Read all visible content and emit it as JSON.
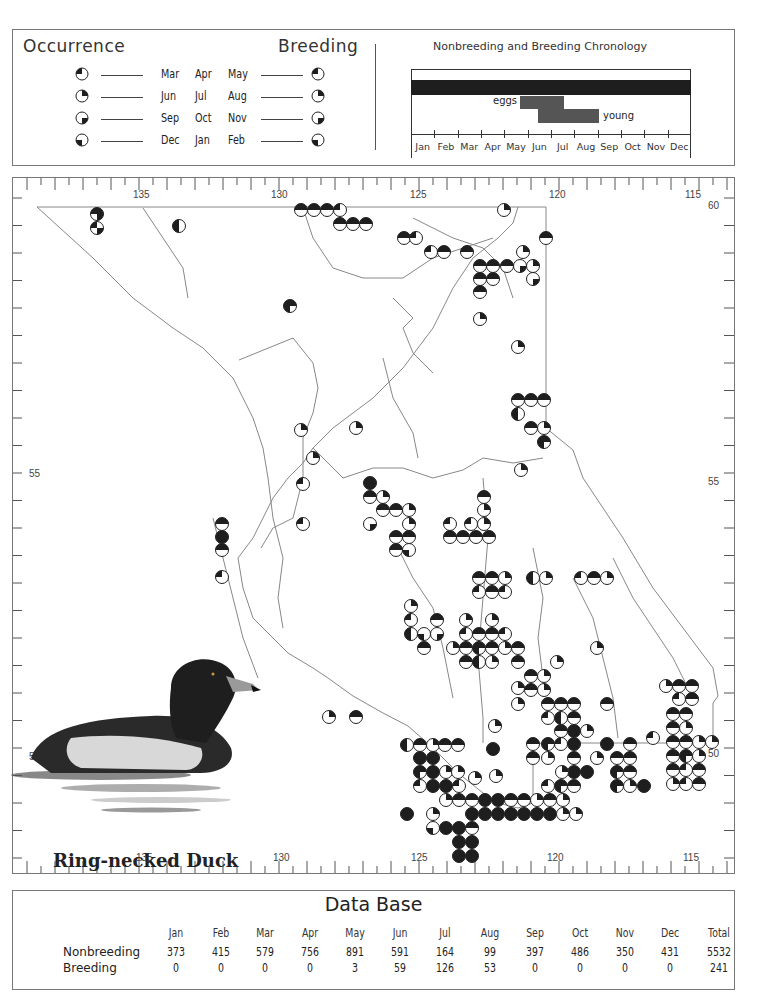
{
  "legend": {
    "occurrence_title": "Occurrence",
    "breeding_title": "Breeding",
    "rows": [
      {
        "months": [
          "Mar",
          "Apr",
          "May"
        ],
        "quadrant": "tl"
      },
      {
        "months": [
          "Jun",
          "Jul",
          "Aug"
        ],
        "quadrant": "tr"
      },
      {
        "months": [
          "Sep",
          "Oct",
          "Nov"
        ],
        "quadrant": "br"
      },
      {
        "months": [
          "Dec",
          "Jan",
          "Feb"
        ],
        "quadrant": "bl"
      }
    ]
  },
  "chronology": {
    "title": "Nonbreeding and Breeding Chronology",
    "months": [
      "Jan",
      "Feb",
      "Mar",
      "Apr",
      "May",
      "Jun",
      "Jul",
      "Aug",
      "Sep",
      "Oct",
      "Nov",
      "Dec"
    ],
    "eggs_label": "eggs",
    "young_label": "young",
    "colors": {
      "nonbreeding": "#1e1e1e",
      "breeding": "#555555"
    }
  },
  "map": {
    "longitude_ticks": [
      "135",
      "130",
      "125",
      "120",
      "115"
    ],
    "latitude_ticks": [
      "60",
      "55",
      "50"
    ],
    "species_title": "Ring-necked Duck"
  },
  "chart_data": {
    "type": "table",
    "title": "Data Base",
    "columns": [
      "Jan",
      "Feb",
      "Mar",
      "Apr",
      "May",
      "Jun",
      "Jul",
      "Aug",
      "Sep",
      "Oct",
      "Nov",
      "Dec",
      "Total"
    ],
    "series": [
      {
        "name": "Nonbreeding",
        "values": [
          373,
          415,
          579,
          756,
          891,
          591,
          164,
          99,
          397,
          486,
          350,
          431,
          5532
        ]
      },
      {
        "name": "Breeding",
        "values": [
          0,
          0,
          0,
          0,
          3,
          59,
          126,
          53,
          0,
          0,
          0,
          0,
          241
        ]
      }
    ],
    "chronology_bars": [
      {
        "name": "nonbreeding",
        "start_month": "Jan",
        "end_month": "Dec"
      },
      {
        "name": "eggs",
        "start_month": "mid-May",
        "end_month": "mid-Jul"
      },
      {
        "name": "young",
        "start_month": "early-Jun",
        "end_month": "end-Aug"
      }
    ]
  },
  "database": {
    "title": "Data Base",
    "headers": [
      "Jan",
      "Feb",
      "Mar",
      "Apr",
      "May",
      "Jun",
      "Jul",
      "Aug",
      "Sep",
      "Oct",
      "Nov",
      "Dec",
      "Total"
    ],
    "rows": [
      {
        "label": "Nonbreeding",
        "values": [
          "373",
          "415",
          "579",
          "756",
          "891",
          "591",
          "164",
          "99",
          "397",
          "486",
          "350",
          "431",
          "5532"
        ]
      },
      {
        "label": "Breeding",
        "values": [
          "0",
          "0",
          "0",
          "0",
          "3",
          "59",
          "126",
          "53",
          "0",
          "0",
          "0",
          "0",
          "241"
        ]
      }
    ]
  }
}
